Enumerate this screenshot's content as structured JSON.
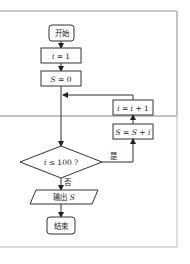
{
  "flowchart": {
    "start": "开始",
    "init_i": {
      "var": "i",
      "op": " = ",
      "val": "1"
    },
    "init_s": {
      "var": "S",
      "op": " = ",
      "val": "0"
    },
    "update_i": {
      "lhs": "i",
      "op": " = ",
      "rhs_var": "i",
      "rhs_rest": " + 1"
    },
    "update_s": {
      "lhs": "S",
      "op": " = ",
      "rhs_var1": "S",
      "plus": " + ",
      "rhs_var2": "i"
    },
    "condition": {
      "var": "i",
      "op": " ≤ ",
      "val": "100 ?"
    },
    "yes_label": "是",
    "no_label": "否",
    "output": {
      "text": "输出 ",
      "var": "S"
    },
    "end": "结束"
  },
  "colors": {
    "line": "#333333",
    "border": "#bbbbbb",
    "background": "#ffffff"
  }
}
